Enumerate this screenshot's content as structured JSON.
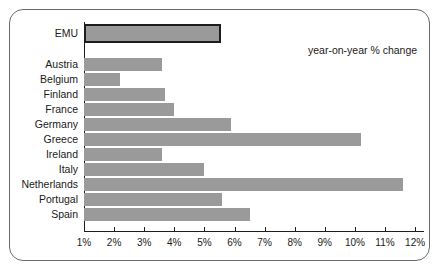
{
  "annotation": {
    "note": "year-on-year % change"
  },
  "axis": {
    "tick_labels": [
      "1%",
      "2%",
      "3%",
      "4%",
      "5%",
      "6%",
      "7%",
      "8%",
      "9%",
      "10%",
      "11%",
      "12%"
    ]
  },
  "colors": {
    "bar_fill": "#9a9a9a",
    "highlight_outline": "#1d1d1d",
    "axis": "#1d1d1d",
    "frame_border": "#6b6b6b",
    "background": "#ffffff",
    "text": "#1a1a1a"
  },
  "chart_data": {
    "type": "bar",
    "orientation": "horizontal",
    "title": "",
    "subtitle": "",
    "xlabel": "",
    "ylabel": "",
    "annotation": "year-on-year % change",
    "xlim": [
      0.7,
      12.3
    ],
    "xticks": [
      1,
      2,
      3,
      4,
      5,
      6,
      7,
      8,
      9,
      10,
      11,
      12
    ],
    "xtick_labels": [
      "1%",
      "2%",
      "3%",
      "4%",
      "5%",
      "6%",
      "7%",
      "8%",
      "9%",
      "10%",
      "11%",
      "12%"
    ],
    "grid": false,
    "legend": "none",
    "categories": [
      "EMU",
      "Austria",
      "Belgium",
      "Finland",
      "France",
      "Germany",
      "Greece",
      "Ireland",
      "Italy",
      "Netherlands",
      "Portugal",
      "Spain"
    ],
    "values": [
      5.25,
      3.3,
      1.9,
      3.4,
      3.7,
      5.6,
      9.9,
      3.3,
      4.7,
      11.3,
      5.3,
      6.2
    ],
    "highlighted": [
      "EMU"
    ],
    "series": [
      {
        "name": "year-on-year % change",
        "values": [
          5.25,
          3.3,
          1.9,
          3.4,
          3.7,
          5.6,
          9.9,
          3.3,
          4.7,
          11.3,
          5.3,
          6.2
        ]
      }
    ]
  }
}
